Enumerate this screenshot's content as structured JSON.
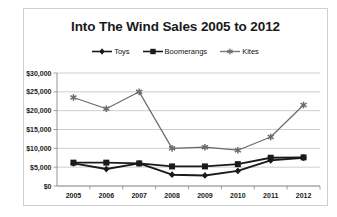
{
  "chart_data": {
    "type": "line",
    "title": "Into The Wind Sales 2005 to 2012",
    "xlabel": "",
    "ylabel": "",
    "categories": [
      "2005",
      "2006",
      "2007",
      "2008",
      "2009",
      "2010",
      "2011",
      "2012"
    ],
    "ylim": [
      0,
      30000
    ],
    "yticks": [
      "$0",
      "$5,000",
      "$10,000",
      "$15,000",
      "$20,000",
      "$25,000",
      "$30,000"
    ],
    "ytick_values": [
      0,
      5000,
      10000,
      15000,
      20000,
      25000,
      30000
    ],
    "grid": true,
    "legend_position": "top",
    "series": [
      {
        "name": "Toys",
        "marker": "diamond",
        "color": "#1a1a1a",
        "values": [
          6000,
          4500,
          6000,
          3000,
          2800,
          4000,
          6800,
          7500
        ]
      },
      {
        "name": "Boomerangs",
        "marker": "square",
        "color": "#1a1a1a",
        "values": [
          6200,
          6200,
          6000,
          5200,
          5200,
          5800,
          7500,
          7600
        ]
      },
      {
        "name": "Kites",
        "marker": "asterisk",
        "color": "#6b6b6b",
        "values": [
          23500,
          20500,
          25000,
          10000,
          10300,
          9500,
          13000,
          21500
        ]
      }
    ]
  }
}
